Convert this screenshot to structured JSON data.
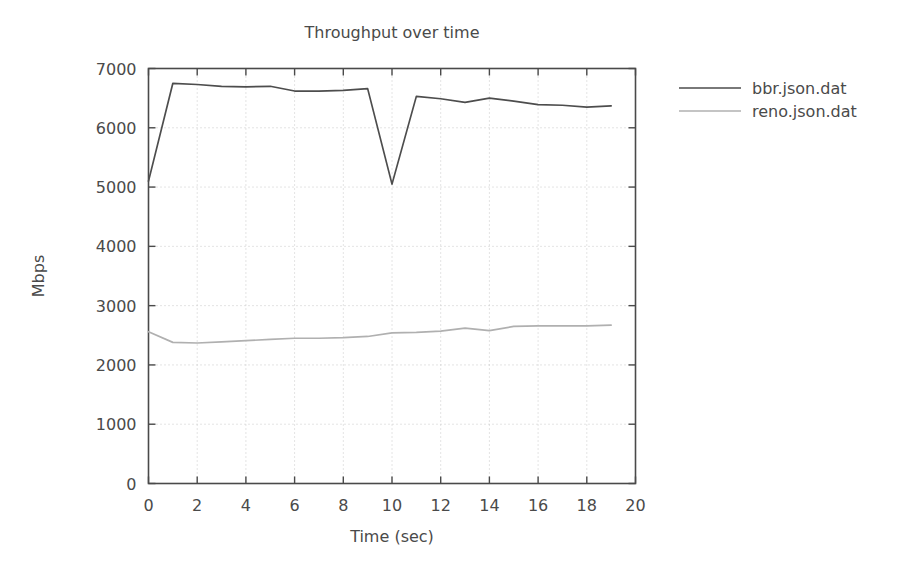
{
  "chart_data": {
    "type": "line",
    "title": "Throughput over time",
    "xlabel": "Time (sec)",
    "ylabel": "Mbps",
    "xlim": [
      0,
      20
    ],
    "ylim": [
      0,
      7000
    ],
    "xticks": [
      0,
      2,
      4,
      6,
      8,
      10,
      12,
      14,
      16,
      18,
      20
    ],
    "yticks": [
      0,
      1000,
      2000,
      3000,
      4000,
      5000,
      6000,
      7000
    ],
    "xtick_labels": [
      "0",
      "2",
      "4",
      "6",
      "8",
      "10",
      "12",
      "14",
      "16",
      "18",
      "20"
    ],
    "ytick_labels": [
      "0",
      "1000",
      "2000",
      "3000",
      "4000",
      "5000",
      "6000",
      "7000"
    ],
    "grid": true,
    "legend_position": "right-outside",
    "x": [
      0,
      1,
      2,
      3,
      4,
      5,
      6,
      7,
      8,
      9,
      10,
      11,
      12,
      13,
      14,
      15,
      16,
      17,
      18,
      19
    ],
    "series": [
      {
        "name": "bbr.json.dat",
        "color": "#4d4d4d",
        "values": [
          5100,
          6750,
          6730,
          6700,
          6690,
          6700,
          6620,
          6620,
          6630,
          6660,
          5050,
          6530,
          6490,
          6430,
          6500,
          6450,
          6390,
          6380,
          6350,
          6370
        ]
      },
      {
        "name": "reno.json.dat",
        "color": "#b0b0b0",
        "values": [
          2560,
          2380,
          2370,
          2390,
          2410,
          2430,
          2450,
          2450,
          2460,
          2480,
          2540,
          2550,
          2570,
          2620,
          2580,
          2650,
          2660,
          2660,
          2660,
          2670
        ]
      }
    ]
  },
  "legend": {
    "entries": [
      {
        "label": "bbr.json.dat",
        "color": "#4d4d4d"
      },
      {
        "label": "reno.json.dat",
        "color": "#b0b0b0"
      }
    ]
  },
  "colors": {
    "background": "#ffffff",
    "axis": "#4a4a4a",
    "grid": "#c8c8c8",
    "text": "#4a4a4a"
  }
}
